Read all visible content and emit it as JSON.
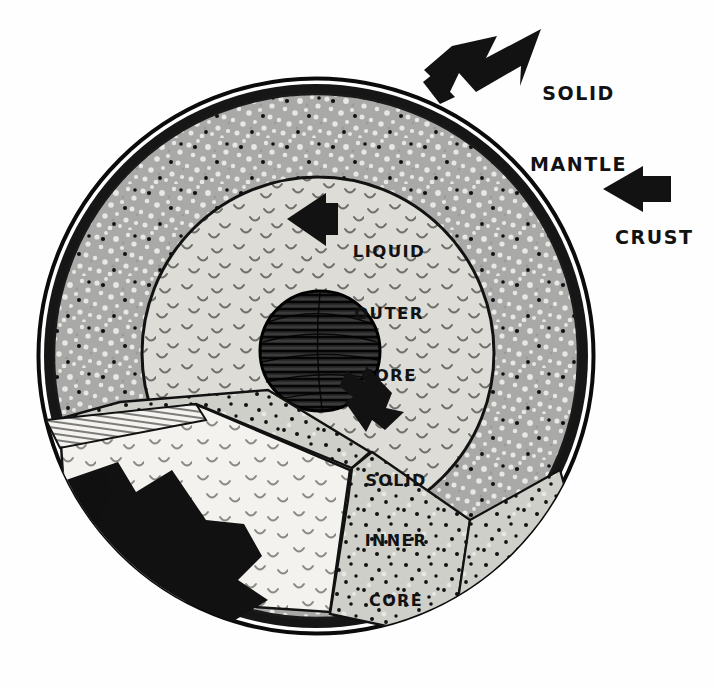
{
  "diagram": {
    "background_color": "#fefefe",
    "ink_color": "#121212"
  },
  "labels": {
    "solid_mantle": {
      "line1": "SOLID",
      "line2": "MANTLE"
    },
    "crust": {
      "line1": "CRUST"
    },
    "liquid_outer_core": {
      "line1": "LIQUID",
      "line2": "OUTER",
      "line3": "CORE"
    },
    "solid_inner_core": {
      "line1": "SOLID",
      "line2": "INNER",
      "line3": "CORE"
    }
  },
  "layers": [
    {
      "name": "crust",
      "label": "CRUST",
      "color": "#151515",
      "description": "thin black outer rim"
    },
    {
      "name": "mantle",
      "label": "SOLID MANTLE",
      "color": "#a8a8a8",
      "description": "speckled grey band with black dots"
    },
    {
      "name": "outer-core",
      "label": "LIQUID OUTER CORE",
      "color": "#dcdcd8",
      "description": "light grey region with small curved tick marks"
    },
    {
      "name": "inner-core",
      "label": "SOLID INNER CORE",
      "color": "#2b2b2b",
      "description": "dark hatched sphere at center"
    }
  ],
  "geometry": {
    "sphere_center_x": 316,
    "sphere_center_y": 356,
    "sphere_radius": 278,
    "crust_thickness": 13,
    "outer_core_radius": 176,
    "inner_core_center_x": 320,
    "inner_core_center_y": 351,
    "inner_core_radius": 60
  },
  "arrows": [
    {
      "name": "mantle-arrow",
      "direction": "down-left",
      "points_to": "mantle"
    },
    {
      "name": "crust-arrow",
      "direction": "left",
      "points_to": "crust"
    },
    {
      "name": "outer-core-arrow",
      "direction": "left",
      "points_to": "outer-core"
    },
    {
      "name": "inner-core-arrow",
      "direction": "up-left",
      "points_to": "inner-core"
    }
  ]
}
